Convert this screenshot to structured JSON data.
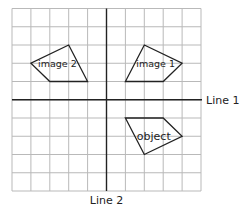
{
  "diagram": {
    "type": "coordinate-grid-reflection",
    "grid": {
      "columns": 10,
      "rows": 10,
      "x_range": [
        -5,
        5
      ],
      "y_range": [
        -5,
        5
      ]
    },
    "axes": {
      "horizontal": {
        "label": "Line 1"
      },
      "vertical": {
        "label": "Line 2"
      }
    },
    "colors": {
      "grid": "#b9b9b9",
      "axis": "#222222",
      "shape": "#222222",
      "text": "#222222"
    },
    "shapes": [
      {
        "id": "object",
        "label": "object",
        "vertices": [
          [
            1,
            -1
          ],
          [
            3,
            -1
          ],
          [
            4,
            -2
          ],
          [
            2,
            -3
          ]
        ],
        "label_at": [
          2.5,
          -2
        ]
      },
      {
        "id": "image-1",
        "label": "image 1",
        "vertices": [
          [
            2,
            3
          ],
          [
            4,
            2
          ],
          [
            3,
            1
          ],
          [
            1,
            1
          ]
        ],
        "label_at": [
          2.6,
          2
        ]
      },
      {
        "id": "image-2",
        "label": "image 2",
        "vertices": [
          [
            -2,
            3
          ],
          [
            -4,
            2
          ],
          [
            -3,
            1
          ],
          [
            -1,
            1
          ]
        ],
        "label_at": [
          -2.6,
          2
        ]
      }
    ]
  }
}
